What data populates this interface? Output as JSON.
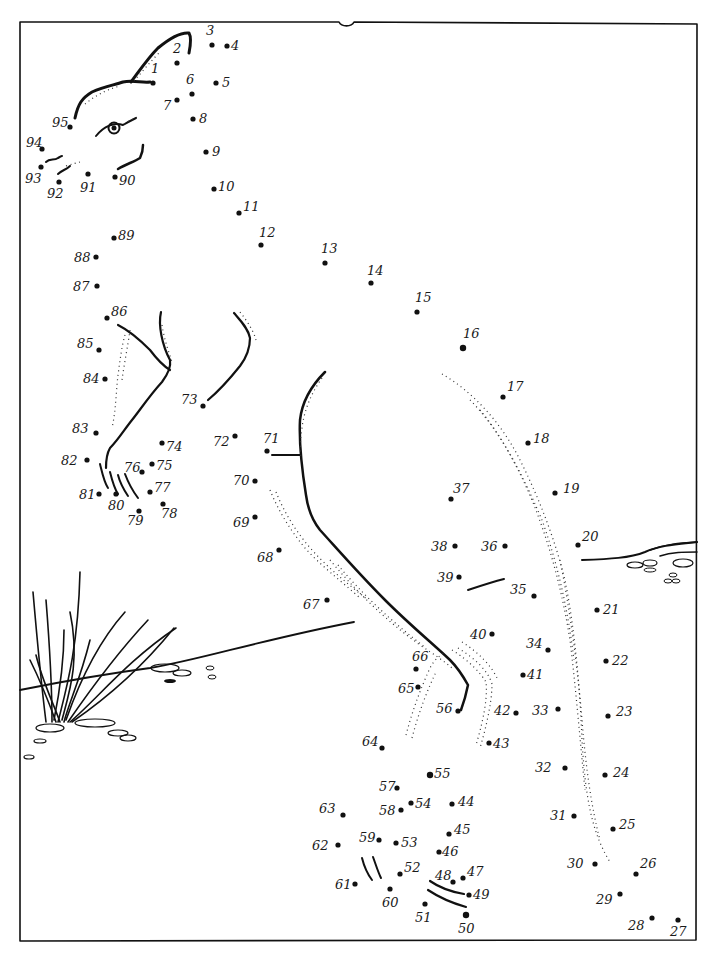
{
  "page": {
    "ink_color": "#111111",
    "paper_color": "#ffffff"
  },
  "puzzle": {
    "first_dot": 1,
    "last_dot": 95,
    "dots": [
      {
        "n": 1,
        "x": 153,
        "y": 83,
        "lx": -2,
        "ly": -10
      },
      {
        "n": 2,
        "x": 177,
        "y": 63,
        "lx": -4,
        "ly": -10
      },
      {
        "n": 3,
        "x": 212,
        "y": 45,
        "lx": -6,
        "ly": -10
      },
      {
        "n": 4,
        "x": 227,
        "y": 46,
        "lx": 4,
        "ly": 4
      },
      {
        "n": 5,
        "x": 216,
        "y": 83,
        "lx": 6,
        "ly": 4
      },
      {
        "n": 6,
        "x": 192,
        "y": 94,
        "lx": -6,
        "ly": -10
      },
      {
        "n": 7,
        "x": 177,
        "y": 100,
        "lx": -14,
        "ly": 10
      },
      {
        "n": 8,
        "x": 193,
        "y": 119,
        "lx": 6,
        "ly": 4
      },
      {
        "n": 9,
        "x": 206,
        "y": 152,
        "lx": 6,
        "ly": 4
      },
      {
        "n": 10,
        "x": 214,
        "y": 189,
        "lx": 4,
        "ly": 2
      },
      {
        "n": 11,
        "x": 239,
        "y": 213,
        "lx": 4,
        "ly": -2
      },
      {
        "n": 12,
        "x": 261,
        "y": 245,
        "lx": -2,
        "ly": -8
      },
      {
        "n": 13,
        "x": 325,
        "y": 263,
        "lx": -4,
        "ly": -10
      },
      {
        "n": 14,
        "x": 371,
        "y": 283,
        "lx": -4,
        "ly": -8
      },
      {
        "n": 15,
        "x": 417,
        "y": 312,
        "lx": -2,
        "ly": -10
      },
      {
        "n": 16,
        "x": 463,
        "y": 348,
        "lx": 0,
        "ly": -10
      },
      {
        "n": 17,
        "x": 503,
        "y": 397,
        "lx": 4,
        "ly": -6
      },
      {
        "n": 18,
        "x": 528,
        "y": 443,
        "lx": 5,
        "ly": 0
      },
      {
        "n": 19,
        "x": 555,
        "y": 493,
        "lx": 8,
        "ly": 0
      },
      {
        "n": 20,
        "x": 578,
        "y": 545,
        "lx": 4,
        "ly": -4
      },
      {
        "n": 21,
        "x": 597,
        "y": 610,
        "lx": 6,
        "ly": 4
      },
      {
        "n": 22,
        "x": 606,
        "y": 661,
        "lx": 6,
        "ly": 4
      },
      {
        "n": 23,
        "x": 608,
        "y": 716,
        "lx": 8,
        "ly": 0
      },
      {
        "n": 24,
        "x": 605,
        "y": 775,
        "lx": 8,
        "ly": 2
      },
      {
        "n": 25,
        "x": 613,
        "y": 829,
        "lx": 6,
        "ly": 0
      },
      {
        "n": 26,
        "x": 636,
        "y": 874,
        "lx": 4,
        "ly": -6
      },
      {
        "n": 27,
        "x": 678,
        "y": 920,
        "lx": -8,
        "ly": 16
      },
      {
        "n": 28,
        "x": 652,
        "y": 918,
        "lx": -24,
        "ly": 12
      },
      {
        "n": 29,
        "x": 620,
        "y": 894,
        "lx": -24,
        "ly": 10
      },
      {
        "n": 30,
        "x": 595,
        "y": 864,
        "lx": -28,
        "ly": 4
      },
      {
        "n": 31,
        "x": 574,
        "y": 816,
        "lx": -24,
        "ly": 4
      },
      {
        "n": 32,
        "x": 565,
        "y": 768,
        "lx": -30,
        "ly": 4
      },
      {
        "n": 33,
        "x": 558,
        "y": 709,
        "lx": -26,
        "ly": 6
      },
      {
        "n": 34,
        "x": 548,
        "y": 650,
        "lx": -22,
        "ly": -2
      },
      {
        "n": 35,
        "x": 534,
        "y": 596,
        "lx": -24,
        "ly": -2
      },
      {
        "n": 36,
        "x": 505,
        "y": 546,
        "lx": -24,
        "ly": 5
      },
      {
        "n": 37,
        "x": 451,
        "y": 499,
        "lx": 2,
        "ly": -6
      },
      {
        "n": 38,
        "x": 455,
        "y": 546,
        "lx": -24,
        "ly": 5
      },
      {
        "n": 39,
        "x": 459,
        "y": 577,
        "lx": -22,
        "ly": 5
      },
      {
        "n": 40,
        "x": 492,
        "y": 634,
        "lx": -22,
        "ly": 5
      },
      {
        "n": 41,
        "x": 523,
        "y": 675,
        "lx": 4,
        "ly": 4
      },
      {
        "n": 42,
        "x": 516,
        "y": 713,
        "lx": -22,
        "ly": 2
      },
      {
        "n": 43,
        "x": 489,
        "y": 743,
        "lx": 4,
        "ly": 5
      },
      {
        "n": 44,
        "x": 452,
        "y": 804,
        "lx": 6,
        "ly": 2
      },
      {
        "n": 45,
        "x": 449,
        "y": 834,
        "lx": 5,
        "ly": 0
      },
      {
        "n": 46,
        "x": 439,
        "y": 852,
        "lx": 3,
        "ly": 4
      },
      {
        "n": 47,
        "x": 463,
        "y": 878,
        "lx": 4,
        "ly": -2
      },
      {
        "n": 48,
        "x": 453,
        "y": 882,
        "lx": -18,
        "ly": -2
      },
      {
        "n": 49,
        "x": 469,
        "y": 895,
        "lx": 4,
        "ly": 4
      },
      {
        "n": 50,
        "x": 466,
        "y": 915,
        "lx": -8,
        "ly": 18
      },
      {
        "n": 51,
        "x": 425,
        "y": 904,
        "lx": -10,
        "ly": 18
      },
      {
        "n": 52,
        "x": 400,
        "y": 874,
        "lx": 4,
        "ly": -2
      },
      {
        "n": 53,
        "x": 396,
        "y": 843,
        "lx": 5,
        "ly": 4
      },
      {
        "n": 54,
        "x": 411,
        "y": 803,
        "lx": 4,
        "ly": 5
      },
      {
        "n": 55,
        "x": 430,
        "y": 775,
        "lx": 4,
        "ly": 3
      },
      {
        "n": 56,
        "x": 458,
        "y": 711,
        "lx": -22,
        "ly": 2
      },
      {
        "n": 57,
        "x": 397,
        "y": 788,
        "lx": -18,
        "ly": 3
      },
      {
        "n": 58,
        "x": 401,
        "y": 810,
        "lx": -22,
        "ly": 5
      },
      {
        "n": 59,
        "x": 379,
        "y": 840,
        "lx": -20,
        "ly": 2
      },
      {
        "n": 60,
        "x": 390,
        "y": 889,
        "lx": -8,
        "ly": 18
      },
      {
        "n": 61,
        "x": 355,
        "y": 884,
        "lx": -20,
        "ly": 5
      },
      {
        "n": 62,
        "x": 338,
        "y": 845,
        "lx": -26,
        "ly": 5
      },
      {
        "n": 63,
        "x": 343,
        "y": 815,
        "lx": -24,
        "ly": -2
      },
      {
        "n": 64,
        "x": 382,
        "y": 748,
        "lx": -20,
        "ly": -2
      },
      {
        "n": 65,
        "x": 418,
        "y": 687,
        "lx": -20,
        "ly": 6
      },
      {
        "n": 66,
        "x": 416,
        "y": 669,
        "lx": -4,
        "ly": -8
      },
      {
        "n": 67,
        "x": 327,
        "y": 600,
        "lx": -24,
        "ly": 9
      },
      {
        "n": 68,
        "x": 279,
        "y": 550,
        "lx": -22,
        "ly": 12
      },
      {
        "n": 69,
        "x": 255,
        "y": 517,
        "lx": -22,
        "ly": 10
      },
      {
        "n": 70,
        "x": 255,
        "y": 481,
        "lx": -22,
        "ly": 4
      },
      {
        "n": 71,
        "x": 267,
        "y": 451,
        "lx": -4,
        "ly": -8
      },
      {
        "n": 72,
        "x": 235,
        "y": 436,
        "lx": -22,
        "ly": 10
      },
      {
        "n": 73,
        "x": 203,
        "y": 406,
        "lx": -22,
        "ly": -2
      },
      {
        "n": 74,
        "x": 162,
        "y": 443,
        "lx": 4,
        "ly": 8
      },
      {
        "n": 75,
        "x": 152,
        "y": 464,
        "lx": 4,
        "ly": 6
      },
      {
        "n": 76,
        "x": 142,
        "y": 472,
        "lx": -18,
        "ly": 0
      },
      {
        "n": 77,
        "x": 150,
        "y": 492,
        "lx": 4,
        "ly": 0
      },
      {
        "n": 78,
        "x": 163,
        "y": 504,
        "lx": -2,
        "ly": 14
      },
      {
        "n": 79,
        "x": 139,
        "y": 511,
        "lx": -12,
        "ly": 14
      },
      {
        "n": 80,
        "x": 116,
        "y": 494,
        "lx": -8,
        "ly": 16
      },
      {
        "n": 81,
        "x": 99,
        "y": 494,
        "lx": -20,
        "ly": 5
      },
      {
        "n": 82,
        "x": 87,
        "y": 460,
        "lx": -26,
        "ly": 5
      },
      {
        "n": 83,
        "x": 96,
        "y": 433,
        "lx": -24,
        "ly": 0
      },
      {
        "n": 84,
        "x": 105,
        "y": 379,
        "lx": -22,
        "ly": 4
      },
      {
        "n": 85,
        "x": 99,
        "y": 350,
        "lx": -22,
        "ly": -2
      },
      {
        "n": 86,
        "x": 107,
        "y": 318,
        "lx": 4,
        "ly": -2
      },
      {
        "n": 87,
        "x": 97,
        "y": 286,
        "lx": -24,
        "ly": 5
      },
      {
        "n": 88,
        "x": 96,
        "y": 257,
        "lx": -22,
        "ly": 5
      },
      {
        "n": 89,
        "x": 114,
        "y": 238,
        "lx": 4,
        "ly": 2
      },
      {
        "n": 90,
        "x": 115,
        "y": 177,
        "lx": 4,
        "ly": 8
      },
      {
        "n": 91,
        "x": 88,
        "y": 174,
        "lx": -8,
        "ly": 18
      },
      {
        "n": 92,
        "x": 59,
        "y": 182,
        "lx": -12,
        "ly": 16
      },
      {
        "n": 93,
        "x": 41,
        "y": 167,
        "lx": -16,
        "ly": 16
      },
      {
        "n": 94,
        "x": 42,
        "y": 149,
        "lx": -16,
        "ly": -2
      },
      {
        "n": 95,
        "x": 70,
        "y": 127,
        "lx": -18,
        "ly": 0
      }
    ]
  }
}
